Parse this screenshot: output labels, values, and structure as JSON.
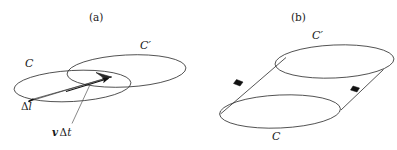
{
  "figure": {
    "panels": [
      {
        "id": "a",
        "caption": "(a)",
        "labels": {
          "curve_c": "C",
          "curve_c_prime": "C′",
          "delta_l_delta": "Δ",
          "delta_l_var": "l",
          "velocity_v": "v",
          "velocity_delta": "Δ",
          "velocity_t": "t"
        },
        "colors": {
          "stroke": "#1a1a1a",
          "sliver_fill": "#bfbfbf",
          "arrow_fill": "#111111",
          "leader_line": "#555555"
        }
      },
      {
        "id": "b",
        "caption": "(b)",
        "labels": {
          "curve_c": "C",
          "curve_c_prime": "C′"
        },
        "colors": {
          "stroke": "#1a1a1a",
          "marker_fill": "#111111"
        }
      }
    ]
  }
}
